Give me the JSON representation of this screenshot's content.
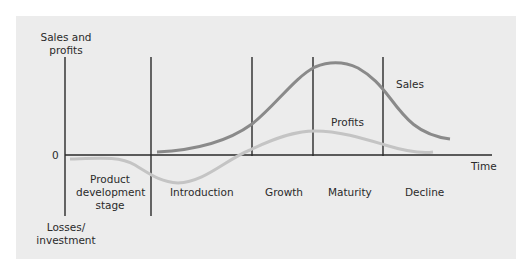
{
  "diagram": {
    "y_axis": {
      "top_label": "Sales and profits",
      "bottom_label": "Losses/ investment",
      "zero_label": "0"
    },
    "x_axis": {
      "label": "Time"
    },
    "stages": [
      {
        "label": "Product development stage"
      },
      {
        "label": "Introduction"
      },
      {
        "label": "Growth"
      },
      {
        "label": "Maturity"
      },
      {
        "label": "Decline"
      }
    ],
    "curves": [
      {
        "name": "Sales",
        "color": "#8a8a8a"
      },
      {
        "name": "Profits",
        "color": "#c4c4c4"
      }
    ],
    "colors": {
      "background": "#ececec",
      "axis": "#2a2a2a"
    }
  }
}
